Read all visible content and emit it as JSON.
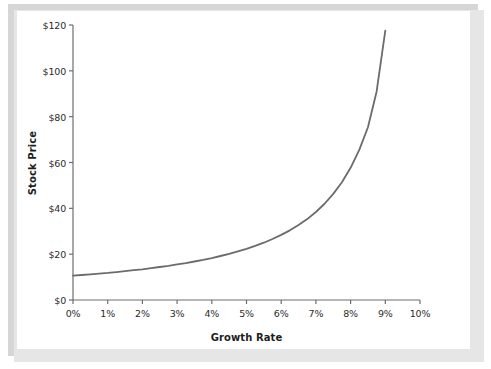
{
  "figure": {
    "background_color": "#ffffff",
    "panel_color": "#ffffff",
    "frame_color": "#d6d6d6",
    "axis_color": "#6e6e6e",
    "curve_color": "#6b6b6b",
    "text_color": "#2b2b2b"
  },
  "chart_data": {
    "type": "line",
    "title": "",
    "xlabel": "Growth Rate",
    "ylabel": "Stock Price",
    "xlim": [
      0,
      10
    ],
    "ylim": [
      0,
      120
    ],
    "grid": false,
    "legend": null,
    "x_tick_labels": [
      "0%",
      "1%",
      "2%",
      "3%",
      "4%",
      "5%",
      "6%",
      "7%",
      "8%",
      "9%",
      "10%"
    ],
    "x_tick_values": [
      0,
      1,
      2,
      3,
      4,
      5,
      6,
      7,
      8,
      9,
      10
    ],
    "y_tick_labels": [
      "$0",
      "$20",
      "$40",
      "$60",
      "$80",
      "$100",
      "$120"
    ],
    "y_tick_values": [
      0,
      20,
      40,
      60,
      80,
      100,
      120
    ],
    "series": [
      {
        "name": "Stock Price",
        "color": "#6b6b6b",
        "line_width": 1.8,
        "x": [
          0,
          0.25,
          0.5,
          0.75,
          1,
          1.25,
          1.5,
          1.75,
          2,
          2.25,
          2.5,
          2.75,
          3,
          3.25,
          3.5,
          3.75,
          4,
          4.25,
          4.5,
          4.75,
          5,
          5.25,
          5.5,
          5.75,
          6,
          6.25,
          6.5,
          6.75,
          7,
          7.25,
          7.5,
          7.75,
          8,
          8.25,
          8.5,
          8.75,
          9
        ],
        "y": [
          10.6,
          10.9,
          11.2,
          11.5,
          11.8,
          12.2,
          12.6,
          13.0,
          13.4,
          13.9,
          14.4,
          14.9,
          15.5,
          16.1,
          16.8,
          17.5,
          18.3,
          19.2,
          20.1,
          21.2,
          22.3,
          23.6,
          25.0,
          26.6,
          28.4,
          30.4,
          32.7,
          35.3,
          38.4,
          42.0,
          46.3,
          51.4,
          57.7,
          65.5,
          75.4,
          91.0,
          117.5
        ]
      }
    ]
  },
  "axis_geometry": {
    "plot_left_px": 73,
    "plot_right_px": 420,
    "plot_bottom_px": 300,
    "plot_top_px": 25
  }
}
